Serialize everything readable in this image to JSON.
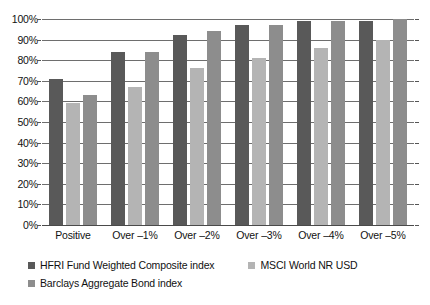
{
  "chart_data": {
    "type": "bar",
    "title": "",
    "subtitle": "",
    "xlabel": "",
    "ylabel": "",
    "ylim": [
      0,
      100
    ],
    "grid": true,
    "legend_position": "bottom-left",
    "y_ticks": [
      "0%",
      "10%",
      "20%",
      "30%",
      "40%",
      "50%",
      "60%",
      "70%",
      "80%",
      "90%",
      "100%"
    ],
    "y_tick_values": [
      0,
      10,
      20,
      30,
      40,
      50,
      60,
      70,
      80,
      90,
      100
    ],
    "categories": [
      "Positive",
      "Over –1%",
      "Over –2%",
      "Over –3%",
      "Over –4%",
      "Over –5%"
    ],
    "series": [
      {
        "name": "HFRI Fund Weighted Composite index",
        "color": "#595959",
        "values": [
          71,
          84,
          92,
          97,
          99,
          99
        ]
      },
      {
        "name": "MSCI World NR USD",
        "color": "#b4b4b4",
        "values": [
          59,
          67,
          76,
          81,
          86,
          90
        ]
      },
      {
        "name": "Barclays Aggregate Bond index",
        "color": "#8d8d8d",
        "values": [
          63,
          84,
          94,
          97,
          99,
          100
        ]
      }
    ]
  },
  "legend": {
    "rows": [
      [
        {
          "label": "HFRI Fund Weighted Composite index",
          "series": 0
        },
        {
          "label": "MSCI World NR USD",
          "series": 1
        }
      ],
      [
        {
          "label": "Barclays Aggregate Bond index",
          "series": 2
        }
      ]
    ]
  }
}
